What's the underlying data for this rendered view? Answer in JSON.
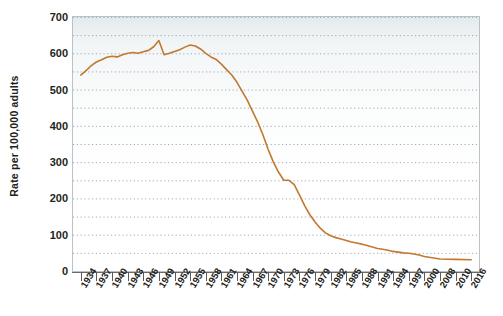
{
  "chart_data": {
    "type": "line",
    "title": "",
    "subtitle": "",
    "xlabel": "",
    "ylabel": "Rate per 100,000 adults",
    "ylim": [
      0,
      700
    ],
    "yticks": [
      0,
      100,
      200,
      300,
      400,
      500,
      600,
      700
    ],
    "xlim": [
      1934,
      2016
    ],
    "xticks": [
      "1934",
      "1937",
      "1940",
      "1943",
      "1946",
      "1949",
      "1952",
      "1955",
      "1958",
      "1961",
      "1964",
      "1967",
      "1970",
      "1973",
      "1976",
      "1979",
      "1982",
      "1985",
      "1988",
      "1991",
      "1994",
      "1997",
      "2000",
      "2008",
      "2010",
      "2016"
    ],
    "grid": "horizontal-dotted-minor-50",
    "legend": "none",
    "series": [
      {
        "name": "Rate per 100,000 adults",
        "color": "#c2782e",
        "x": [
          1934,
          1935,
          1936,
          1937,
          1938,
          1939,
          1940,
          1941,
          1942,
          1943,
          1944,
          1945,
          1946,
          1947,
          1948,
          1949,
          1950,
          1951,
          1952,
          1953,
          1954,
          1955,
          1956,
          1957,
          1958,
          1959,
          1960,
          1961,
          1962,
          1963,
          1964,
          1965,
          1966,
          1967,
          1968,
          1969,
          1970,
          1971,
          1972,
          1973,
          1974,
          1975,
          1976,
          1977,
          1978,
          1979,
          1980,
          1981,
          1982,
          1983,
          1984,
          1985,
          1986,
          1987,
          1988,
          1989,
          1990,
          1991,
          1992,
          1993,
          1994,
          1995,
          1996,
          1997,
          1998,
          1999,
          2000,
          2008,
          2010,
          2016
        ],
        "y": [
          540,
          552,
          566,
          576,
          582,
          589,
          592,
          590,
          596,
          600,
          602,
          600,
          604,
          608,
          618,
          635,
          596,
          600,
          605,
          610,
          617,
          623,
          620,
          612,
          600,
          590,
          583,
          570,
          555,
          540,
          520,
          495,
          470,
          440,
          410,
          375,
          335,
          300,
          272,
          250,
          250,
          238,
          210,
          180,
          155,
          135,
          118,
          105,
          97,
          92,
          88,
          84,
          80,
          77,
          74,
          70,
          66,
          62,
          60,
          57,
          54,
          52,
          50,
          49,
          47,
          44,
          40,
          33,
          32,
          31
        ]
      }
    ]
  }
}
